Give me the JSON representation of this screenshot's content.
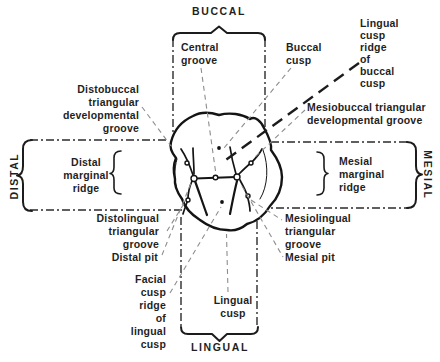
{
  "figure_type": "occlusal-view-tooth-anatomy-diagram",
  "colors": {
    "background": "#ffffff",
    "ink": "#1c1c1c",
    "leader": "#8d8d8d"
  },
  "orientation_labels": {
    "buccal": "BUCCAL",
    "lingual": "LINGUAL",
    "distal": "DISTAL",
    "mesial": "MESIAL"
  },
  "annotations": {
    "central_groove": {
      "lines": [
        "Central",
        "groove"
      ]
    },
    "buccal_cusp": {
      "lines": [
        "Buccal",
        "cusp"
      ]
    },
    "lingual_cusp_ridge_of_buccal_cusp": {
      "lines": [
        "Lingual",
        "cusp",
        "ridge",
        "of",
        "buccal",
        "cusp"
      ]
    },
    "distobuccal_triangular_developmental_groove": {
      "lines": [
        "Distobuccal",
        "triangular",
        "developmental",
        "groove"
      ]
    },
    "mesiobuccal_triangular_developmental_groove": {
      "lines": [
        "Mesiobuccal triangular",
        "developmental groove"
      ]
    },
    "distal_marginal_ridge": {
      "lines": [
        "Distal",
        "marginal",
        "ridge"
      ]
    },
    "mesial_marginal_ridge": {
      "lines": [
        "Mesial",
        "marginal",
        "ridge"
      ]
    },
    "distolingual_triangular_groove": {
      "lines": [
        "Distolingual",
        "triangular",
        "groove"
      ]
    },
    "mesiolingual_triangular_groove": {
      "lines": [
        "Mesiolingual",
        "triangular",
        "groove"
      ]
    },
    "distal_pit": {
      "lines": [
        "Distal pit"
      ]
    },
    "mesial_pit": {
      "lines": [
        "Mesial pit"
      ]
    },
    "facial_cusp_ridge_of_lingual_cusp": {
      "lines": [
        "Facial",
        "cusp",
        "ridge",
        "of",
        "lingual",
        "cusp"
      ]
    },
    "lingual_cusp": {
      "lines": [
        "Lingual",
        "cusp"
      ]
    }
  }
}
